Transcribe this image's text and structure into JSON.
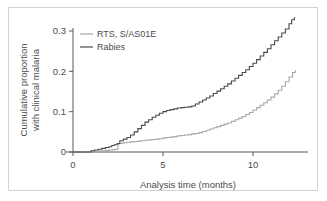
{
  "figure": {
    "frame_color": "#d2d2d2",
    "background": "#ffffff"
  },
  "chart_data": {
    "type": "line",
    "title": "",
    "xlabel": "Analysis time (months)",
    "ylabel": "Cumulative proportion with clinical malaria",
    "ylabel_line1": "Cumulative proportion",
    "ylabel_line2": "with clinical malaria",
    "xlim": [
      0,
      12.4
    ],
    "ylim": [
      0,
      0.345
    ],
    "xticks": [
      0,
      5,
      10
    ],
    "xticklabels": [
      "0",
      "5",
      "10"
    ],
    "yticks": [
      0,
      0.1,
      0.2,
      0.3
    ],
    "yticklabels": [
      "0",
      "0.1",
      "0.2",
      "0.3"
    ],
    "grid": false,
    "legend_position": "upper left",
    "step_plot": true,
    "series": [
      {
        "name": "RTS, S/AS01E",
        "color": "#a8a8aa",
        "x": [
          0,
          0.9,
          1.2,
          1.5,
          1.8,
          2.0,
          2.2,
          2.35,
          2.5,
          2.6,
          2.7,
          2.85,
          3.0,
          3.2,
          3.4,
          3.6,
          3.8,
          4.0,
          4.2,
          4.4,
          4.6,
          4.8,
          5.0,
          5.2,
          5.4,
          5.6,
          5.8,
          6.0,
          6.2,
          6.4,
          6.6,
          6.8,
          7.0,
          7.2,
          7.4,
          7.6,
          7.8,
          8.0,
          8.2,
          8.4,
          8.6,
          8.8,
          9.0,
          9.2,
          9.4,
          9.6,
          9.8,
          10.0,
          10.2,
          10.4,
          10.6,
          10.8,
          11.0,
          11.2,
          11.4,
          11.6,
          11.8,
          12.0,
          12.2,
          12.35
        ],
        "y": [
          0,
          0,
          0.002,
          0.003,
          0.004,
          0.005,
          0.006,
          0.007,
          0.02,
          0.021,
          0.022,
          0.023,
          0.024,
          0.025,
          0.026,
          0.027,
          0.028,
          0.029,
          0.03,
          0.031,
          0.032,
          0.033,
          0.035,
          0.036,
          0.037,
          0.038,
          0.04,
          0.041,
          0.042,
          0.043,
          0.045,
          0.046,
          0.048,
          0.051,
          0.054,
          0.057,
          0.06,
          0.063,
          0.066,
          0.069,
          0.072,
          0.076,
          0.08,
          0.084,
          0.088,
          0.093,
          0.098,
          0.104,
          0.11,
          0.116,
          0.122,
          0.129,
          0.136,
          0.144,
          0.153,
          0.163,
          0.174,
          0.186,
          0.197,
          0.203
        ],
        "final_value": 0.203
      },
      {
        "name": "Rabies",
        "color": "#4a4a4c",
        "x": [
          0,
          0.85,
          1.0,
          1.2,
          1.4,
          1.6,
          1.8,
          2.0,
          2.15,
          2.3,
          2.45,
          2.6,
          2.8,
          3.0,
          3.2,
          3.4,
          3.6,
          3.8,
          4.0,
          4.2,
          4.4,
          4.6,
          4.8,
          5.0,
          5.2,
          5.4,
          5.6,
          5.8,
          6.0,
          6.2,
          6.4,
          6.6,
          6.8,
          7.0,
          7.2,
          7.4,
          7.6,
          7.8,
          8.0,
          8.2,
          8.4,
          8.6,
          8.8,
          9.0,
          9.2,
          9.4,
          9.6,
          9.8,
          10.0,
          10.2,
          10.4,
          10.6,
          10.8,
          11.0,
          11.2,
          11.4,
          11.6,
          11.8,
          12.0,
          12.15,
          12.3
        ],
        "y": [
          0,
          0,
          0.003,
          0.005,
          0.007,
          0.009,
          0.011,
          0.013,
          0.016,
          0.018,
          0.021,
          0.028,
          0.032,
          0.036,
          0.042,
          0.05,
          0.058,
          0.066,
          0.074,
          0.08,
          0.086,
          0.091,
          0.096,
          0.1,
          0.103,
          0.105,
          0.107,
          0.109,
          0.11,
          0.111,
          0.112,
          0.114,
          0.119,
          0.124,
          0.129,
          0.134,
          0.139,
          0.145,
          0.151,
          0.157,
          0.163,
          0.169,
          0.176,
          0.183,
          0.19,
          0.197,
          0.204,
          0.212,
          0.22,
          0.229,
          0.238,
          0.247,
          0.256,
          0.266,
          0.276,
          0.285,
          0.295,
          0.305,
          0.318,
          0.328,
          0.335
        ],
        "final_value": 0.335
      }
    ]
  },
  "legend": {
    "items": [
      {
        "label": "RTS, S/AS01E",
        "color": "#a8a8aa"
      },
      {
        "label": "Rabies",
        "color": "#4a4a4c"
      }
    ]
  }
}
